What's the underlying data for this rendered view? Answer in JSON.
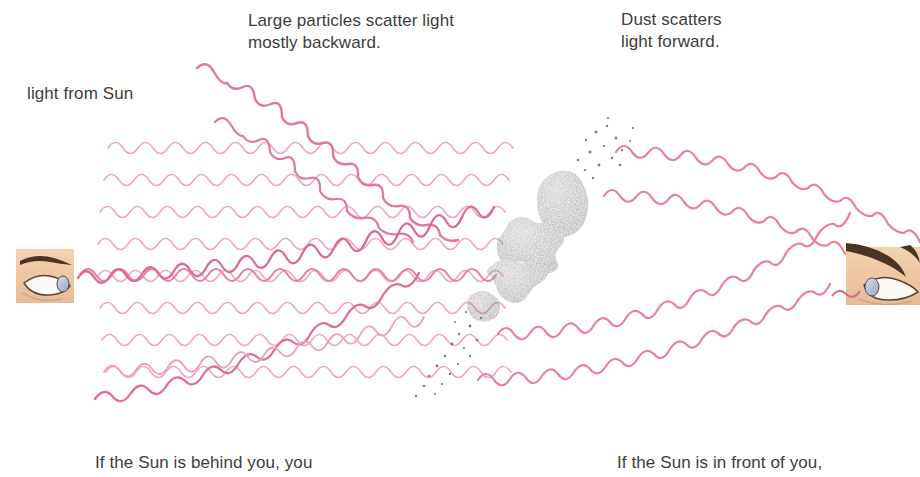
{
  "figure": {
    "kind": "scientific-illustration",
    "background_color": "#ffffff"
  },
  "captions": {
    "large_particles": "Large particles scatter light\nmostly backward.",
    "dust": "Dust scatters\nlight forward.",
    "light_source": "light from Sun",
    "bottom_left": "If the Sun is behind you, you",
    "bottom_right": "If the Sun is in front of you,"
  },
  "colors": {
    "wave_light": "#efa9bd",
    "wave_mid": "#e8819d",
    "wave_strong": "#d94f77",
    "particle_dark": "#55544f",
    "particle_light": "#8d8c86",
    "skin": "#f0c9a4",
    "skin_shadow": "#e0b084",
    "brow": "#4a3426",
    "iris": "#b9bfd0",
    "text": "#3d3d3d"
  },
  "waves": {
    "incoming_label": "incoming sunlight waves travelling left to right",
    "incoming_count": 8,
    "backscattered_count": 3,
    "forward_scattered_count": 4
  },
  "particles": {
    "large_label": "large scattering particles",
    "count": 4,
    "items": [
      {
        "name": "particle-1",
        "cx": 568,
        "cy": 205,
        "rx": 27,
        "ry": 34,
        "rot": -22
      },
      {
        "name": "particle-2",
        "cx": 533,
        "cy": 240,
        "rx": 30,
        "ry": 24,
        "rot": 12
      },
      {
        "name": "particle-3",
        "cx": 513,
        "cy": 275,
        "rx": 25,
        "ry": 19,
        "rot": -8
      },
      {
        "name": "particle-4",
        "cx": 483,
        "cy": 305,
        "rx": 16,
        "ry": 14,
        "rot": 6
      }
    ]
  },
  "dust": {
    "label": "fine dust specks",
    "upper_cluster": "forward-scattering dust above the particles",
    "lower_cluster": "forward-scattering dust below the particles"
  },
  "observers": [
    {
      "name": "observer-left",
      "label": "eye of observer with Sun behind",
      "x": 16,
      "y": 249,
      "w": 58,
      "h": 54
    },
    {
      "name": "observer-right",
      "label": "eye of observer with Sun in front",
      "x": 846,
      "y": 249,
      "w": 74,
      "h": 56
    }
  ]
}
